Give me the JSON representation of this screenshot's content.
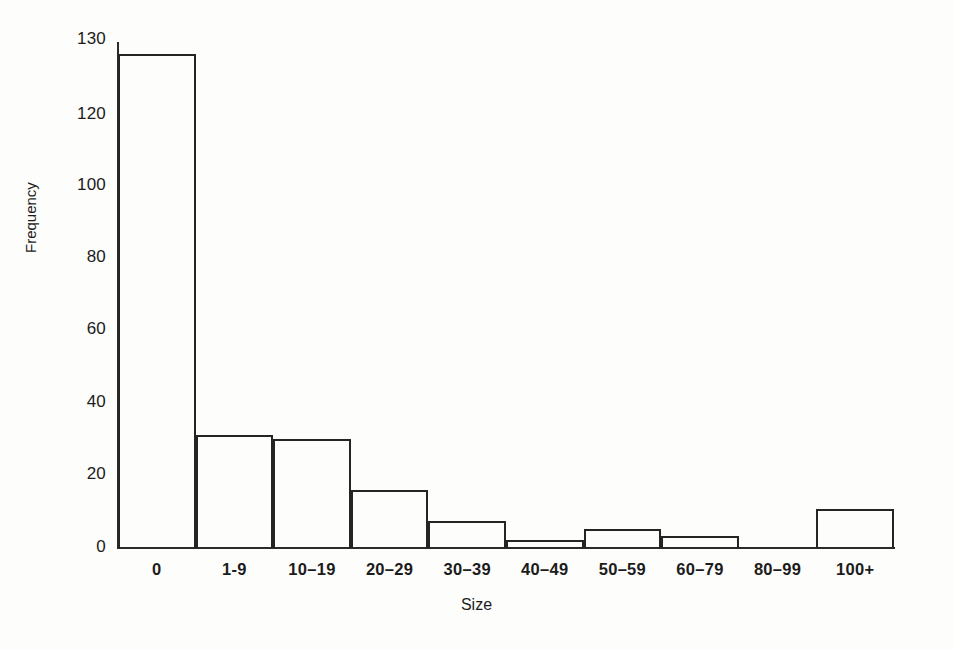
{
  "figure": {
    "background_color": "#fdfdfb",
    "line_color": "#242424",
    "axis_title_x": "Size",
    "axis_title_y": "Frequency"
  },
  "chart_data": {
    "type": "bar",
    "title": "",
    "subtitle": "",
    "xlabel": "Size",
    "ylabel": "Frequency",
    "categories": [
      "0",
      "1-9",
      "10–19",
      "20–29",
      "30–39",
      "40–49",
      "50–59",
      "60–79",
      "80–99",
      "100+"
    ],
    "values": [
      127,
      29,
      28,
      15,
      7,
      2,
      5,
      3,
      0,
      10
    ],
    "ylim": [
      0,
      130
    ],
    "yticks": [
      0,
      20,
      40,
      60,
      80,
      100,
      120,
      130
    ],
    "ytick_labels": [
      "0",
      "20",
      "40",
      "60",
      "80",
      "100",
      "120",
      "130"
    ],
    "grid": false,
    "legend": null,
    "bar_style": "outline",
    "bar_fill": "none",
    "bar_edge_color": "#242424"
  }
}
